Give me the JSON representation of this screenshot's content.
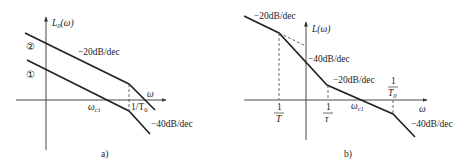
{
  "panel_a": {
    "caption": "a)",
    "y_axis_label": "L",
    "y_axis_sub": "0",
    "y_axis_arg": "(ω)",
    "x_axis_label": "ω",
    "curve_2_marker": "②",
    "curve_1_marker": "①",
    "slope_upper": "−20dB/dec",
    "slope_lower": "−40dB/dec",
    "crossover_label": "ω",
    "crossover_sub": "c1",
    "corner_label": "1/T",
    "corner_sub": "0"
  },
  "panel_b": {
    "caption": "b)",
    "y_axis_label": "L(ω)",
    "x_axis_label": "ω",
    "slope_1": "−20dB/dec",
    "slope_2": "−40dB/dec",
    "slope_3": "−20dB/dec",
    "slope_4": "−40dB/dec",
    "tick_T_num": "1",
    "tick_T_den": "T",
    "tick_tau_num": "1",
    "tick_tau_den": "τ",
    "tick_T0_num": "1",
    "tick_T0_den": "T",
    "tick_T0_sub": "0",
    "crossover_label": "ω",
    "crossover_sub": "c1"
  },
  "colors": {
    "line": "#222222",
    "axis": "#333333",
    "text": "#222222"
  }
}
